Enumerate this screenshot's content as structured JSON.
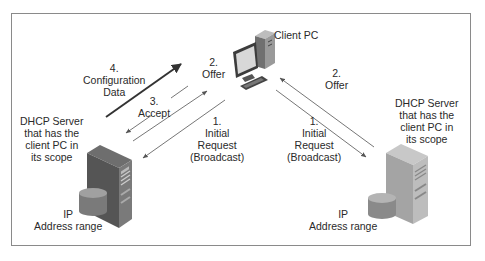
{
  "diagram": {
    "client": {
      "label": "Client PC"
    },
    "left_server": {
      "label_lines": [
        "DHCP Server",
        "that has the",
        "client PC in",
        "its scope"
      ],
      "range_lines": [
        "IP",
        "Address range"
      ]
    },
    "right_server": {
      "label_lines": [
        "DHCP Server",
        "that has the",
        "client PC in",
        "its scope"
      ],
      "range_lines": [
        "IP",
        "Address range"
      ]
    },
    "left_messages": [
      {
        "step": "4.",
        "lines": [
          "Configuration",
          "Data"
        ],
        "direction": "server-to-client",
        "emphasis": "bold"
      },
      {
        "step": "2.",
        "lines": [
          "Offer"
        ],
        "direction": "server-to-client"
      },
      {
        "step": "3.",
        "lines": [
          "Accept"
        ],
        "direction": "client-to-server"
      },
      {
        "step": "1.",
        "lines": [
          "Initial",
          "Request",
          "(Broadcast)"
        ],
        "direction": "client-to-server"
      }
    ],
    "right_messages": [
      {
        "step": "2.",
        "lines": [
          "Offer"
        ],
        "direction": "server-to-client"
      },
      {
        "step": "1.",
        "lines": [
          "Initial",
          "Request",
          "(Broadcast)"
        ],
        "direction": "client-to-server"
      }
    ],
    "colors": {
      "frame": "#8a8a8a",
      "arrow": "#555555",
      "arrow_bold": "#333333",
      "server_front": "#5a5a5a",
      "server_side_right": "#9a9a9a",
      "disk": "#8c8c8c"
    }
  }
}
